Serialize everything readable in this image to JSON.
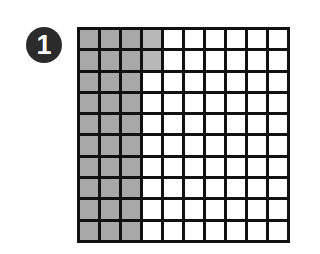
{
  "badge": {
    "label": "1"
  },
  "grid": {
    "rows": 10,
    "columns": 10,
    "shaded_cells": 32,
    "total_cells": 100,
    "shaded_full_columns": 3,
    "partial_column_shaded_rows": 2,
    "colors": {
      "shaded": "#a8a8a8",
      "shaded_light": "#b8b8b8",
      "empty": "#ffffff",
      "lines": "#111111"
    }
  }
}
